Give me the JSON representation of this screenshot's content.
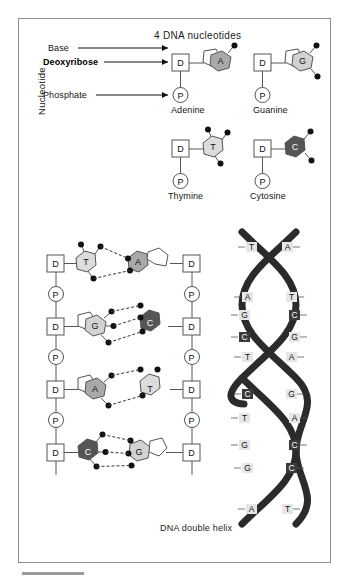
{
  "figure": {
    "title": "4 DNA nucleotides",
    "caption": "DNA double helix",
    "side_label": "Nucleotide"
  },
  "callouts": [
    {
      "label": "Base",
      "bold": false
    },
    {
      "label": "Deoxyribose",
      "bold": true
    },
    {
      "label": "Phosphate",
      "bold": false
    }
  ],
  "symbols": {
    "deoxyribose": "D",
    "phosphate": "P"
  },
  "nucleotides": [
    {
      "name": "Adenine",
      "letter": "A",
      "shade": "#a9a9a9",
      "sugar_ring": true,
      "dots": 1
    },
    {
      "name": "Guanine",
      "letter": "G",
      "shade": "#d2d2d2",
      "sugar_ring": true,
      "dots": 2
    },
    {
      "name": "Thymine",
      "letter": "T",
      "shade": "#dcdcdc",
      "sugar_ring": false,
      "dots": 3
    },
    {
      "name": "Cytosine",
      "letter": "C",
      "shade": "#555555",
      "sugar_ring": false,
      "dots": 2
    }
  ],
  "ladder": {
    "backbone_sequence": [
      "D",
      "P",
      "D",
      "P",
      "D",
      "P",
      "D"
    ],
    "rungs": [
      {
        "left_base": "T",
        "right_base": "A",
        "hydrogen_bonds": 2,
        "left_shade": "#dcdcdc",
        "right_shade": "#a9a9a9",
        "ring_side": "right"
      },
      {
        "left_base": "G",
        "right_base": "C",
        "hydrogen_bonds": 3,
        "left_shade": "#d2d2d2",
        "right_shade": "#555555",
        "ring_side": "left"
      },
      {
        "left_base": "A",
        "right_base": "T",
        "hydrogen_bonds": 2,
        "left_shade": "#a9a9a9",
        "right_shade": "#dcdcdc",
        "ring_side": "left"
      },
      {
        "left_base": "C",
        "right_base": "G",
        "hydrogen_bonds": 3,
        "left_shade": "#555555",
        "right_shade": "#d2d2d2",
        "ring_side": "right"
      }
    ]
  },
  "helix": {
    "pairs": [
      {
        "left": "T",
        "right": "A",
        "left_dark": false,
        "right_dark": false
      },
      {
        "left": "A",
        "right": "T",
        "left_dark": false,
        "right_dark": false
      },
      {
        "left": "G",
        "right": "C",
        "left_dark": false,
        "right_dark": true
      },
      {
        "left": "C",
        "right": "G",
        "left_dark": true,
        "right_dark": false
      },
      {
        "left": "T",
        "right": "A",
        "left_dark": false,
        "right_dark": false
      },
      {
        "left": "C",
        "right": "G",
        "left_dark": true,
        "right_dark": false
      },
      {
        "left": "T",
        "right": "A",
        "left_dark": false,
        "right_dark": false
      },
      {
        "left": "G",
        "right": "C",
        "left_dark": false,
        "right_dark": true
      },
      {
        "left": "G",
        "right": "C",
        "left_dark": false,
        "right_dark": true
      },
      {
        "left": "A",
        "right": "T",
        "left_dark": false,
        "right_dark": false
      }
    ]
  },
  "colors": {
    "stroke": "#555555",
    "ribbon": "#2b2b2b",
    "frame": "#8d8d8d"
  }
}
